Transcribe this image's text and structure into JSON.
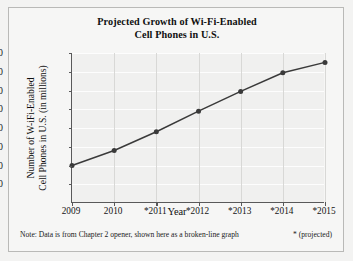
{
  "chart_data": {
    "type": "line",
    "title": "Projected Growth of Wi-Fi-Enabled Cell Phones in U.S.",
    "title_line1": "Projected Growth of Wi-Fi-Enabled",
    "title_line2": "Cell Phones in U.S.",
    "xlabel": "Year",
    "ylabel": "Number of W-iFi-Enabled Cell Phones in U.S. (in millions)",
    "ylabel_line1": "Number of W-iFi-Enabled",
    "ylabel_line2": "Cell Phones in U.S. (in millions)",
    "categories": [
      "2009",
      "2010",
      "*2011",
      "*2012",
      "*2013",
      "*2014",
      "*2015"
    ],
    "values": [
      40,
      56,
      76,
      98,
      119,
      139,
      150
    ],
    "ylim": [
      0,
      160
    ],
    "yticks": [
      160,
      140,
      120,
      100,
      80,
      60,
      40,
      20
    ],
    "grid": "horizontal-and-vertical",
    "legend": "none",
    "marker": "filled-circle",
    "line_color": "#3a3a3a",
    "plot_bg": "#f0f0ef",
    "figure_bg": "#f6f6f5"
  },
  "footnote": {
    "note": "Note: Data is from Chapter 2 opener, shown here as a broken-line graph",
    "key": "* (projected)"
  }
}
